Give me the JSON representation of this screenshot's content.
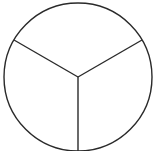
{
  "diagram": {
    "type": "circle-divided-into-thirds",
    "parts": 3,
    "stroke_color": "#2a2a2a",
    "background": "#ffffff"
  }
}
